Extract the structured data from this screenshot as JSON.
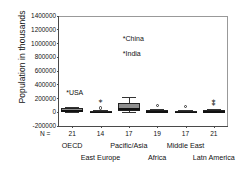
{
  "chart_data": {
    "type": "box",
    "title": "",
    "xlabel": "",
    "ylabel": "Population in thousands",
    "ylim": [
      -200000,
      1400000
    ],
    "ytick_labels": [
      "1400000",
      "1200000",
      "1000000",
      "800000",
      "600000",
      "400000",
      "200000",
      "0",
      "-200000"
    ],
    "ytick_values": [
      1400000,
      1200000,
      1000000,
      800000,
      600000,
      400000,
      200000,
      0,
      -200000
    ],
    "grid": false,
    "legend": "none",
    "n_prefix": "N =",
    "categories": [
      "OECD",
      "East Europe",
      "Pacific/Asia",
      "Africa",
      "Middle East",
      "Latn America"
    ],
    "n_values": [
      "21",
      "14",
      "17",
      "19",
      "17",
      "21"
    ],
    "series": [
      {
        "name": "OECD",
        "n": 21,
        "min": 5000,
        "q1": 10000,
        "median": 28000,
        "q3": 58000,
        "max": 82000,
        "outliers": [],
        "star_outliers": []
      },
      {
        "name": "East Europe",
        "n": 14,
        "min": 2000,
        "q1": 5000,
        "median": 10000,
        "q3": 22000,
        "max": 38000,
        "outliers": [
          62000
        ],
        "star_outliers": [
          148000
        ]
      },
      {
        "name": "Pacific/Asia",
        "n": 17,
        "min": 4000,
        "q1": 18000,
        "median": 55000,
        "q3": 130000,
        "max": 215000,
        "outliers": [],
        "star_outliers": []
      },
      {
        "name": "Africa",
        "n": 19,
        "min": 1000,
        "q1": 5000,
        "median": 12000,
        "q3": 26000,
        "max": 48000,
        "outliers": [
          95000
        ],
        "star_outliers": []
      },
      {
        "name": "Middle East",
        "n": 17,
        "min": 1000,
        "q1": 4000,
        "median": 9000,
        "q3": 20000,
        "max": 34000,
        "outliers": [
          78000
        ],
        "star_outliers": []
      },
      {
        "name": "Latn America",
        "n": 21,
        "min": 2000,
        "q1": 6000,
        "median": 13000,
        "q3": 28000,
        "max": 45000,
        "outliers": [],
        "star_outliers": [
          105000,
          152000
        ]
      }
    ],
    "annotations": [
      {
        "label": "*China",
        "value": 1050000,
        "category": "Pacific/Asia"
      },
      {
        "label": "*India",
        "value": 830000,
        "category": "Pacific/Asia"
      },
      {
        "label": "*USA",
        "value": 260000,
        "category": "OECD"
      }
    ]
  }
}
